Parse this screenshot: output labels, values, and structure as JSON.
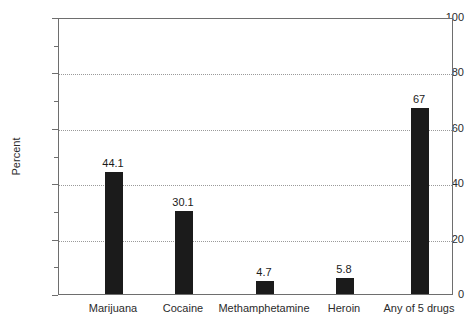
{
  "chart_data": {
    "type": "bar",
    "title": "",
    "subtitle": "",
    "xlabel": "",
    "ylabel": "Percent",
    "ylim": [
      0,
      100
    ],
    "grid": "horizontal-dotted-at-major-ticks",
    "legend": "none",
    "categories": [
      "Marijuana",
      "Cocaine",
      "Methamphetamine",
      "Heroin",
      "Any of 5 drugs"
    ],
    "values": [
      44.1,
      30.1,
      4.7,
      5.8,
      67
    ],
    "value_labels": [
      "44.1",
      "30.1",
      "4.7",
      "5.8",
      "67"
    ],
    "bar_color": "#1b1b1b",
    "y_ticks_major": [
      0,
      20,
      40,
      60,
      80,
      100
    ],
    "y_tick_labels": [
      "0",
      "20",
      "40",
      "60",
      "80",
      "100"
    ],
    "y_ticks_minor": [
      10,
      30,
      50,
      70,
      90
    ],
    "gridline_values": [
      20,
      40,
      60,
      80
    ]
  },
  "axes": {
    "y_title": "Percent"
  }
}
